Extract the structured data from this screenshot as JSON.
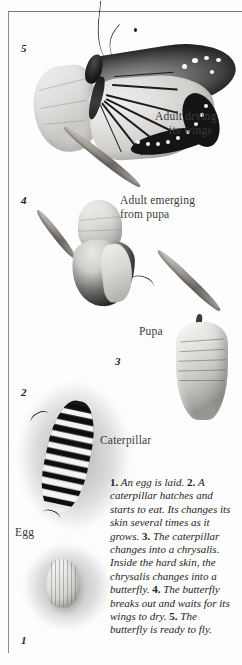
{
  "document": {
    "title": "Butterfly life cycle diagram",
    "type": "illustrated-lifecycle-figure"
  },
  "stage_numbers": {
    "five": "5",
    "four": "4",
    "three": "3",
    "two": "2",
    "one": "1"
  },
  "labels": {
    "adult_drying_line1": "Adult drying",
    "adult_drying_line2": "its wings",
    "adult_emerging_line1": "Adult emerging",
    "adult_emerging_line2": "from pupa",
    "pupa": "Pupa",
    "caterpillar": "Caterpillar",
    "egg": "Egg"
  },
  "caption": {
    "n1": "1.",
    "t1": " An egg is laid. ",
    "n2": "2.",
    "t2": " A caterpillar hatches and starts to eat. Its changes its skin several times as it grows. ",
    "n3": "3.",
    "t3": " The caterpillar changes into a chrysalis. Inside the hard skin, the chrysalis changes into a butterfly. ",
    "n4": "4.",
    "t4": " The butterfly breaks out and waits for its wings to dry. ",
    "n5": "5.",
    "t5": " The butterfly is ready to fly."
  },
  "colors": {
    "page_background": "#fdfdfd",
    "rule": "#7a7a7a",
    "text": "#242424",
    "label_text": "#3a3a3a"
  }
}
